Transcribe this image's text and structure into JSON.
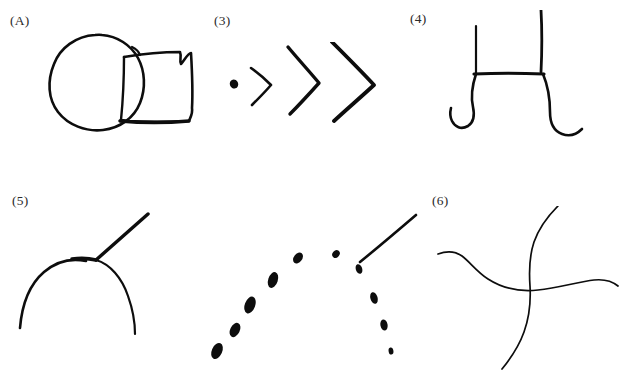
{
  "figure": {
    "background_color": "#ffffff",
    "ink_color": "#0d0d0d",
    "label_color": "#2a2a2a",
    "clipped_heading_text": "                       ",
    "width": 627,
    "height": 390,
    "layout": "2 rows × 3 columns of hand-drawn sketch panels"
  },
  "panels": [
    {
      "id": "a",
      "label": "(A)",
      "description": "hand-drawn oval overlapping a hand-drawn square",
      "elements": [
        "oval",
        "square"
      ]
    },
    {
      "id": "3",
      "label": "(3)",
      "description": "a dot followed by three nested chevrons of increasing size",
      "elements": [
        "dot",
        "small-chevron",
        "medium-chevron",
        "large-chevron"
      ]
    },
    {
      "id": "4",
      "label": "(4)",
      "description": "table-like bracket: horizontal bar with two vertical posts above and two curled legs below",
      "elements": [
        "left-post",
        "right-post",
        "horizontal-bar",
        "left-curl",
        "right-curl"
      ]
    },
    {
      "id": "5",
      "label": "(5)",
      "description": "arch curve with a straight diagonal line rising from its apex",
      "elements": [
        "arch",
        "diagonal-stroke"
      ]
    },
    {
      "id": "dotted",
      "label": "",
      "description": "dotted/dashed rendering of the arch from panel 5 with a solid diagonal line at the apex",
      "elements": [
        "dotted-arch",
        "diagonal-stroke"
      ]
    },
    {
      "id": "6",
      "label": "(6)",
      "description": "two long wavy curves crossing to form an X",
      "elements": [
        "wavy-curve-vertical",
        "wavy-curve-horizontal"
      ]
    }
  ]
}
